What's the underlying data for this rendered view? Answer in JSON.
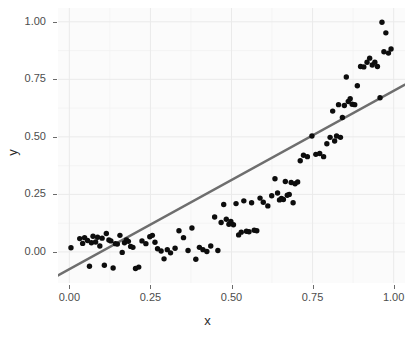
{
  "chart_data": {
    "type": "scatter",
    "title": "",
    "xlabel": "x",
    "ylabel": "y",
    "xlim": [
      -0.035,
      1.035
    ],
    "ylim": [
      -0.135,
      1.06
    ],
    "xticks": [
      0.0,
      0.25,
      0.5,
      0.75,
      1.0
    ],
    "xtick_labels": [
      "0.00",
      "0.25",
      "0.50",
      "0.75",
      "1.00"
    ],
    "yticks": [
      0.0,
      0.25,
      0.5,
      0.75,
      1.0
    ],
    "ytick_labels": [
      "0.00",
      "0.25",
      "0.50",
      "0.75",
      "1.00"
    ],
    "grid": true,
    "legend": false,
    "point_color": "#0d0d0d",
    "point_size": 5.4,
    "panel_background": "#fbfbfb",
    "grid_color": "#eaeaea",
    "series": [
      {
        "name": "points",
        "x": [
          0.005,
          0.032,
          0.041,
          0.047,
          0.056,
          0.062,
          0.068,
          0.073,
          0.081,
          0.087,
          0.094,
          0.101,
          0.108,
          0.114,
          0.122,
          0.128,
          0.135,
          0.142,
          0.148,
          0.156,
          0.163,
          0.17,
          0.176,
          0.182,
          0.189,
          0.196,
          0.204,
          0.214,
          0.224,
          0.236,
          0.248,
          0.256,
          0.264,
          0.272,
          0.283,
          0.292,
          0.302,
          0.312,
          0.326,
          0.338,
          0.352,
          0.366,
          0.378,
          0.39,
          0.401,
          0.412,
          0.424,
          0.436,
          0.448,
          0.458,
          0.468,
          0.476,
          0.484,
          0.492,
          0.498,
          0.506,
          0.514,
          0.522,
          0.53,
          0.538,
          0.546,
          0.554,
          0.562,
          0.57,
          0.578,
          0.588,
          0.598,
          0.612,
          0.624,
          0.634,
          0.642,
          0.648,
          0.654,
          0.66,
          0.666,
          0.672,
          0.678,
          0.684,
          0.69,
          0.696,
          0.704,
          0.712,
          0.722,
          0.734,
          0.748,
          0.76,
          0.772,
          0.784,
          0.794,
          0.804,
          0.812,
          0.818,
          0.824,
          0.83,
          0.836,
          0.842,
          0.848,
          0.854,
          0.86,
          0.866,
          0.872,
          0.88,
          0.888,
          0.898,
          0.908,
          0.918,
          0.926,
          0.934,
          0.942,
          0.95,
          0.958,
          0.964,
          0.97,
          0.976,
          0.984,
          0.992
        ],
        "y": [
          0.018,
          0.058,
          0.037,
          0.062,
          0.05,
          -0.062,
          0.04,
          0.068,
          0.043,
          0.064,
          0.026,
          0.06,
          -0.058,
          0.08,
          0.052,
          0.048,
          -0.07,
          0.036,
          0.034,
          0.072,
          -0.002,
          0.04,
          0.052,
          0.046,
          0.024,
          0.02,
          -0.072,
          -0.066,
          0.048,
          0.036,
          0.066,
          0.072,
          0.042,
          0.014,
          0.004,
          -0.03,
          0.01,
          -0.004,
          0.016,
          0.092,
          0.062,
          0.006,
          0.104,
          -0.032,
          0.02,
          0.01,
          0.002,
          0.026,
          0.152,
          0.006,
          0.128,
          0.206,
          0.142,
          0.12,
          0.132,
          0.118,
          0.21,
          0.074,
          0.086,
          0.222,
          0.09,
          0.088,
          0.214,
          0.094,
          0.092,
          0.234,
          0.216,
          0.2,
          0.244,
          0.318,
          0.256,
          0.226,
          0.232,
          0.228,
          0.306,
          0.246,
          0.25,
          0.302,
          0.214,
          0.296,
          0.304,
          0.396,
          0.42,
          0.414,
          0.504,
          0.424,
          0.428,
          0.414,
          0.47,
          0.498,
          0.612,
          0.482,
          0.504,
          0.64,
          0.498,
          0.584,
          0.636,
          0.76,
          0.654,
          0.666,
          0.642,
          0.64,
          0.722,
          0.806,
          0.804,
          0.824,
          0.842,
          0.812,
          0.824,
          0.806,
          0.67,
          0.998,
          0.87,
          0.952,
          0.864,
          0.882
        ]
      }
    ],
    "trend_line": {
      "type": "linear-fit",
      "color": "#6e6e6e",
      "width": 2.4,
      "x_start": -0.035,
      "y_start": -0.102,
      "x_end": 1.035,
      "y_end": 0.727
    }
  },
  "axes": {
    "y_title": "y",
    "x_title": "x"
  }
}
